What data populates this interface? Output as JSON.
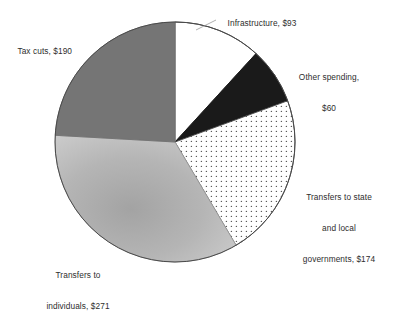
{
  "chart_data": {
    "type": "pie",
    "title": "",
    "subtitle": "",
    "xlabel": "",
    "ylabel": "",
    "legend_position": "none",
    "grid": false,
    "unit": "$ billions",
    "total": 788,
    "start_angle_deg": 0,
    "direction": "clockwise",
    "categories": [
      "Infrastructure",
      "Other spending",
      "Transfers to state and local governments",
      "Transfers to individuals",
      "Tax cuts"
    ],
    "values": [
      93,
      60,
      174,
      271,
      190
    ],
    "slices": [
      {
        "name": "Infrastructure",
        "value": 93,
        "value_label": "$93",
        "angle_deg": 42.5,
        "start_deg": 0,
        "end_deg": 42.5,
        "fill": "#ffffff",
        "pattern": "solid-white",
        "stroke": "#4a4a4a"
      },
      {
        "name": "Other spending",
        "value": 60,
        "value_label": "$60",
        "angle_deg": 27.4,
        "start_deg": 42.5,
        "end_deg": 69.9,
        "fill": "#1a1a1a",
        "pattern": "solid-black",
        "stroke": "#1a1a1a"
      },
      {
        "name": "Transfers to state and local governments",
        "value": 174,
        "value_label": "$174",
        "angle_deg": 79.5,
        "start_deg": 69.9,
        "end_deg": 149.4,
        "fill": "#ffffff",
        "pattern": "dotted",
        "stroke": "#4a4a4a"
      },
      {
        "name": "Transfers to individuals",
        "value": 271,
        "value_label": "$271",
        "angle_deg": 123.8,
        "start_deg": 149.4,
        "end_deg": 273.2,
        "fill": "#b4b4b4",
        "pattern": "gradient-light-gray",
        "stroke": "#8f8f8f"
      },
      {
        "name": "Tax cuts",
        "value": 190,
        "value_label": "$190",
        "angle_deg": 86.8,
        "start_deg": 273.2,
        "end_deg": 360,
        "fill": "#757575",
        "pattern": "solid-medium-gray",
        "stroke": "#6a6a6a"
      }
    ],
    "labels": {
      "infrastructure": "Infrastructure, $93",
      "other_spending_line1": "Other spending,",
      "other_spending_line2": "$60",
      "transfers_state_line1": "Transfers to state",
      "transfers_state_line2": "and local",
      "transfers_state_line3": "governments, $174",
      "transfers_individuals_line1": "Transfers to",
      "transfers_individuals_line2": "individuals, $271",
      "tax_cuts": "Tax cuts, $190"
    },
    "colors": {
      "background": "#ffffff",
      "text": "#2e2e2e",
      "outline": "#4a4a4a",
      "slice_black": "#1a1a1a",
      "slice_medium_gray": "#757575",
      "slice_light_gray": "#b4b4b4",
      "slice_white": "#ffffff"
    },
    "geometry": {
      "center_x": 175,
      "center_y": 142,
      "radius": 120
    }
  }
}
